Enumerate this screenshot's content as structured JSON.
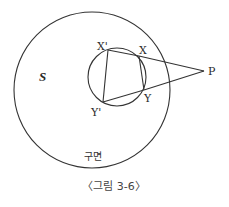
{
  "figure": {
    "caption": "〈그림 3-6〉",
    "sphere_label": "S",
    "surface_label": "구면",
    "points": {
      "X_prime": {
        "label": "X'",
        "x": 108,
        "y": 50
      },
      "X": {
        "label": "X",
        "x": 139,
        "y": 56
      },
      "Y": {
        "label": "Y",
        "x": 144,
        "y": 90
      },
      "Y_prime": {
        "label": "Y'",
        "x": 103,
        "y": 102
      },
      "P": {
        "label": "P",
        "x": 204,
        "y": 71
      }
    },
    "big_circle": {
      "cx": 92,
      "cy": 90,
      "r": 78
    },
    "small_circle": {
      "cx": 117,
      "cy": 77,
      "r": 29
    },
    "colors": {
      "stroke": "#333333",
      "background": "#ffffff"
    }
  }
}
